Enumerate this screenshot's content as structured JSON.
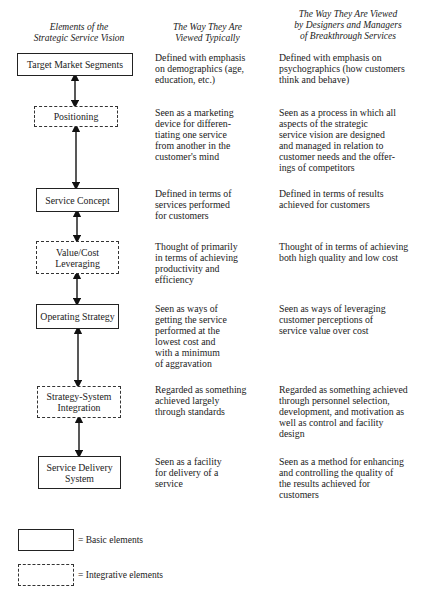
{
  "headers": {
    "col0": "Elements of the\nStrategic Service Vision",
    "col1": "The Way They Are\nViewed Typically",
    "col2": "The Way They Are Viewed\nby Designers and Managers\nof Breakthrough Services"
  },
  "elements": [
    {
      "label": "Target Market Segments",
      "type": "basic",
      "typical": "Defined with emphasis\non demographics (age,\neducation, etc.)",
      "breakthrough": "Defined with emphasis on\npsychographics (how customers\nthink and behave)"
    },
    {
      "label": "Positioning",
      "type": "integrative",
      "typical": "Seen as a marketing\ndevice for differen-\ntiating one service\nfrom another in the\ncustomer's mind",
      "breakthrough": "Seen as a process in which all\naspects of the strategic\nservice vision are designed\nand managed in relation to\ncustomer needs and the offer-\nings of competitors"
    },
    {
      "label": "Service Concept",
      "type": "basic",
      "typical": "Defined in terms of\nservices performed\nfor customers",
      "breakthrough": "Defined in terms of results\nachieved for customers"
    },
    {
      "label": "Value/Cost\nLeveraging",
      "type": "integrative",
      "typical": "Thought of primarily\nin terms of achieving\nproductivity and\nefficiency",
      "breakthrough": "Thought of in terms of achieving\nboth high quality and low cost"
    },
    {
      "label": "Operating Strategy",
      "type": "basic",
      "typical": "Seen as ways of\ngetting the service\nperformed at the\nlowest cost and\nwith a minimum\nof aggravation",
      "breakthrough": "Seen as ways of leveraging\ncustomer perceptions of\nservice value over cost"
    },
    {
      "label": "Strategy-System\nIntegration",
      "type": "integrative",
      "typical": "Regarded as something\nachieved largely\nthrough standards",
      "breakthrough": "Regarded as something achieved\nthrough personnel selection,\ndevelopment, and motivation as\nwell as control and facility\ndesign"
    },
    {
      "label": "Service Delivery\nSystem",
      "type": "basic",
      "typical": "Seen as a facility\nfor delivery of a\nservice",
      "breakthrough": "Seen as a method for enhancing\nand controlling the quality of\nthe results achieved for\ncustomers"
    }
  ],
  "legend": {
    "basic": "= Basic elements",
    "integrative": "= Integrative elements"
  }
}
